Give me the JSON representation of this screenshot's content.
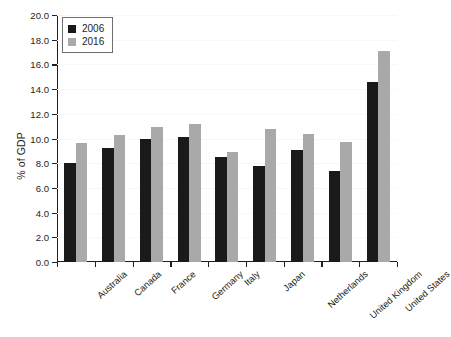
{
  "chart_data": {
    "type": "bar",
    "title": "",
    "xlabel": "",
    "ylabel": "% of GDP",
    "ylim": [
      0.0,
      20.0
    ],
    "ytick_step": 2.0,
    "ytick_labels": [
      "0.0",
      "2.0",
      "4.0",
      "6.0",
      "8.0",
      "10.0",
      "12.0",
      "14.0",
      "16.0",
      "18.0",
      "20.0"
    ],
    "grid": true,
    "legend_position": "top-left-inside",
    "categories": [
      "Australia",
      "Canada",
      "France",
      "Germany",
      "Italy",
      "Japan",
      "Netherlands",
      "United Kingdom",
      "United States"
    ],
    "series": [
      {
        "name": "2006",
        "color": "#1a1a1a",
        "values": [
          8.0,
          9.2,
          10.0,
          10.1,
          8.5,
          7.8,
          9.1,
          7.4,
          14.6
        ]
      },
      {
        "name": "2016",
        "color": "#a9a9a9",
        "values": [
          9.6,
          10.3,
          10.9,
          11.2,
          8.9,
          10.8,
          10.4,
          9.7,
          17.1
        ]
      }
    ]
  },
  "legend": {
    "items": [
      {
        "label": "2006",
        "swatch": "black-square-swatch"
      },
      {
        "label": "2016",
        "swatch": "gray-square-swatch"
      }
    ]
  }
}
